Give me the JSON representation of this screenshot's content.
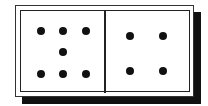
{
  "domino": {
    "left_half": {
      "pips": 7
    },
    "right_half": {
      "pips": 4
    },
    "colors": {
      "pip": "#111111",
      "face": "#ffffff",
      "border": "#222222",
      "shadow": "#111111"
    }
  }
}
